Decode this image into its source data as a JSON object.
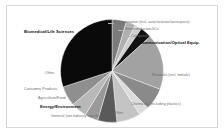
{
  "figure": {
    "name": "industry-sector-pie-chart",
    "background_color": "#ffffff",
    "frame_color": "#d7d7da"
  },
  "chart_data": {
    "type": "pie",
    "title": "",
    "subtitle": "",
    "xlabel": "",
    "ylabel": "",
    "legend_position": "none",
    "grid": false,
    "labels_inline": true,
    "start_angle_deg": 90,
    "direction": "clockwise",
    "categories": [
      "Transportation (incl. auto/aviation/aerospace)",
      "Semiconductors/ICs",
      "Computers",
      "Communication/Optical Equip.",
      "Materials (incl. metals)",
      "Chemicals (including plastics)",
      "Other",
      "General (not industry specific)",
      "Energy/Environment",
      "Agriculture/Food",
      "Consumer Products",
      "Other",
      "Biomedical/Life Sciences"
    ],
    "values": [
      4.5,
      3.0,
      2.2,
      3.6,
      17.5,
      7.0,
      3.2,
      7.5,
      6.0,
      4.2,
      5.0,
      6.3,
      30.0
    ],
    "colors": [
      "#7b7b7b",
      "#b0b0b0",
      "#cfcfcf",
      "#111111",
      "#a2a2a2",
      "#8a8a8a",
      "#dcdcdc",
      "#c4c4c4",
      "#5a5a5a",
      "#9a9a9a",
      "#b8b8b8",
      "#8f8f8f",
      "#0a0a0a"
    ]
  },
  "labels": {
    "transportation": "Transportation (incl. auto/aviation/aerospace)",
    "semiconductors": "Semiconductors/ICs",
    "computers": "Computers",
    "communication": "Communication/Optical Equip.",
    "materials": "Materials (incl. metals)",
    "chemicals": "Chemicals (including plastics)",
    "other_bottom": "Other",
    "general": "General (not industry specific)",
    "energy": "Energy/Environment",
    "agriculture": "Agriculture/Food",
    "consumer": "Consumer Products",
    "other_left": "Other",
    "biomedical": "Biomedical/Life Sciences"
  }
}
